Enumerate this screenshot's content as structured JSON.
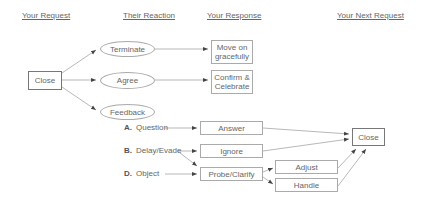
{
  "headers": {
    "your_request": "Your Request",
    "their_reaction": "Their Reaction",
    "your_response": "Your Response",
    "your_next_request": "Your Next Request"
  },
  "nodes": {
    "close_start": "Close",
    "terminate": "Terminate",
    "agree": "Agree",
    "feedback": "Feedback",
    "move_on_line1": "Move on",
    "move_on_line2": "gracefully",
    "confirm_line1": "Confirm &",
    "confirm_line2": "Celebrate",
    "answer": "Answer",
    "ignore": "Ignore",
    "probe_clarify": "Probe/Clarify",
    "adjust": "Adjust",
    "handle": "Handle",
    "close_end": "Close"
  },
  "feedback_types": [
    {
      "letter": "A.",
      "label": "Question"
    },
    {
      "letter": "B.",
      "label": "Delay/Evade"
    },
    {
      "letter": "D.",
      "label": "Object"
    }
  ],
  "colors": {
    "line": "#888888",
    "border": "#aaaaaa",
    "text": "#666666"
  }
}
